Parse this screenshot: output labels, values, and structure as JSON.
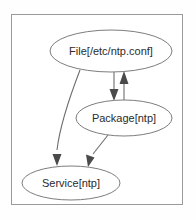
{
  "diagram": {
    "frame": {
      "border_color": "#9a9a9a",
      "background_color": "#ffffff"
    },
    "node_stroke_color": "#7d7d7d",
    "edge_color": "#6e6e6e",
    "text_color": "#2b2b2b",
    "nodes": [
      {
        "id": "file",
        "label": "File[/etc/ntp.conf]",
        "cx": 111,
        "cy": 51,
        "rx": 61,
        "ry": 21
      },
      {
        "id": "package",
        "label": "Package[ntp]",
        "cx": 124,
        "cy": 118,
        "rx": 48,
        "ry": 18
      },
      {
        "id": "service",
        "label": "Service[ntp]",
        "cx": 71,
        "cy": 183,
        "rx": 49,
        "ry": 17
      }
    ],
    "edges": [
      {
        "id": "file-to-service",
        "from": "file",
        "to": "service",
        "kind": "curved",
        "arrow": "end"
      },
      {
        "id": "file-to-package",
        "from": "file",
        "to": "package",
        "kind": "straight",
        "arrow": "end"
      },
      {
        "id": "package-to-file",
        "from": "package",
        "to": "file",
        "kind": "straight",
        "arrow": "end"
      },
      {
        "id": "package-to-service",
        "from": "package",
        "to": "service",
        "kind": "straight",
        "arrow": "end"
      }
    ]
  }
}
